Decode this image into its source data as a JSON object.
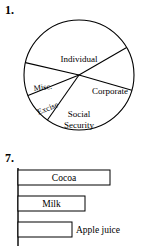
{
  "figures": [
    {
      "number": "1.",
      "type": "pie"
    },
    {
      "number": "7.",
      "type": "bar"
    }
  ],
  "problem_1": {
    "number": "1.",
    "chart_data": {
      "type": "pie",
      "title": "",
      "labels": [
        "Individual",
        "Corporate",
        "Social Security",
        "Excise",
        "Misc."
      ],
      "values": [
        38,
        13,
        30,
        9,
        10
      ],
      "legend": "none",
      "grid": false,
      "slices": [
        {
          "label": "Individual",
          "value": 38,
          "start_deg": 193,
          "end_deg": 330,
          "label_x": 79,
          "label_y": 44,
          "rotation": 0
        },
        {
          "label": "Corporate",
          "value": 13,
          "start_deg": 330,
          "end_deg": 376,
          "label_x": 110,
          "label_y": 76,
          "rotation": 0
        },
        {
          "label": "Social Security",
          "value": 30,
          "start_deg": 16,
          "end_deg": 125,
          "label_x": 79,
          "label_y": 105,
          "rotation": 0
        },
        {
          "label": "Excise",
          "value": 9,
          "start_deg": 125,
          "end_deg": 158,
          "label_x": 48,
          "label_y": 93,
          "rotation": -22
        },
        {
          "label": "Misc.",
          "value": 10,
          "start_deg": 158,
          "end_deg": 193,
          "label_x": 43,
          "label_y": 73,
          "rotation": -8
        }
      ],
      "center_x": 79,
      "center_y": 59,
      "radius": 55
    }
  },
  "problem_7": {
    "number": "7.",
    "chart_data": {
      "type": "bar",
      "orientation": "horizontal",
      "title": "",
      "xlabel": "",
      "ylabel": "",
      "categories": [
        "Cocoa",
        "Milk",
        "Apple juice"
      ],
      "values": [
        92,
        67,
        54
      ],
      "bars": [
        {
          "label": "Cocoa",
          "value": 92,
          "length_px": 92,
          "label_position": "inside"
        },
        {
          "label": "Milk",
          "value": 67,
          "length_px": 67,
          "label_position": "inside"
        },
        {
          "label": "Apple juice",
          "value": 54,
          "length_px": 54,
          "label_position": "outside"
        }
      ],
      "axis": {
        "x_origin": 18,
        "visible": true
      },
      "grid": false,
      "legend": "none"
    }
  },
  "colors": {
    "ink": "#000000",
    "paper": "#ffffff",
    "bar_fill": "#ffffff"
  }
}
